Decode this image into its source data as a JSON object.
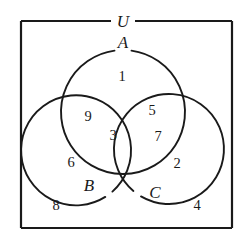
{
  "figure": {
    "type": "venn-diagram-3-set",
    "background_color": "#ffffff",
    "stroke_color": "#1a1a1a"
  },
  "universe": {
    "label": "U",
    "rect": {
      "x": 21,
      "y": 21,
      "width": 211,
      "height": 207
    }
  },
  "sets": [
    {
      "id": "A",
      "label": "A",
      "cx": 123,
      "cy": 112,
      "r": 62,
      "label_x": 123,
      "label_y": 44
    },
    {
      "id": "B",
      "label": "B",
      "cx": 95,
      "cy": 143,
      "r": 55,
      "label_x": 89,
      "label_y": 187
    },
    {
      "id": "C",
      "label": "C",
      "cx": 152,
      "cy": 143,
      "r": 55,
      "label_x": 155,
      "label_y": 194
    }
  ],
  "regions": [
    {
      "id": "A-only",
      "value": "1",
      "x": 122,
      "y": 78
    },
    {
      "id": "A-and-B-only",
      "value": "9",
      "x": 88,
      "y": 118
    },
    {
      "id": "A-and-B-and-C",
      "value": "3",
      "x": 113,
      "y": 137
    },
    {
      "id": "A-and-C-only",
      "value": "5",
      "x": 152,
      "y": 112
    },
    {
      "id": "C-and-A-lower",
      "value": "7",
      "x": 158,
      "y": 138
    },
    {
      "id": "B-only",
      "value": "6",
      "x": 71,
      "y": 164
    },
    {
      "id": "C-only",
      "value": "2",
      "x": 177,
      "y": 165
    },
    {
      "id": "outside-left",
      "value": "8",
      "x": 56,
      "y": 207
    },
    {
      "id": "outside-right",
      "value": "4",
      "x": 197,
      "y": 207
    }
  ]
}
